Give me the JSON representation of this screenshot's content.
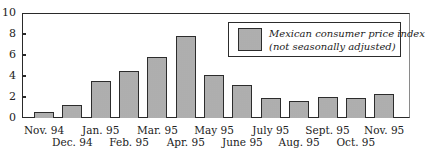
{
  "chart_data": {
    "type": "bar",
    "title": "",
    "xlabel": "",
    "ylabel": "",
    "ylim": [
      0,
      10
    ],
    "yticks": [
      0,
      2,
      4,
      6,
      8,
      10
    ],
    "grid": false,
    "legend_position": "upper right",
    "categories": [
      "Nov. 94",
      "Dec. 94",
      "Jan. 95",
      "Feb. 95",
      "Mar. 95",
      "Apr. 95",
      "May 95",
      "June 95",
      "July 95",
      "Aug. 95",
      "Sept. 95",
      "Oct. 95",
      "Nov. 95"
    ],
    "series": [
      {
        "name": "Mexican consumer price index (not seasonally adjusted)",
        "values": [
          0.6,
          1.2,
          3.5,
          4.5,
          5.8,
          7.8,
          4.1,
          3.1,
          1.9,
          1.6,
          2.0,
          1.9,
          2.3
        ]
      }
    ]
  },
  "legend": {
    "line1": "Mexican consumer price index",
    "line2": "(not seasonally adjusted)"
  },
  "colors": {
    "bar_fill": "#bdbdbd",
    "bar_border": "#2c2c2c"
  }
}
